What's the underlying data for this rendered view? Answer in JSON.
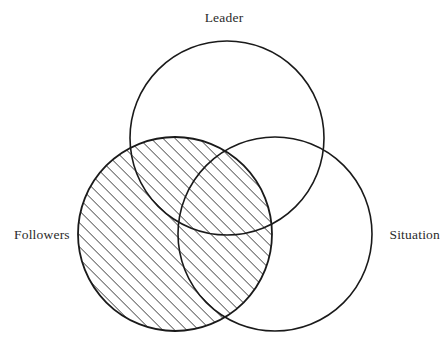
{
  "diagram": {
    "type": "venn-3-circle",
    "title_visible": false,
    "background_color": "#ffffff",
    "stroke_color": "#1a1a1a",
    "hatch_color": "#1a1a1a",
    "label_color": "#2b2b2b",
    "canvas": {
      "width": 448,
      "height": 349
    },
    "labels": {
      "leader": "Leader",
      "followers": "Followers",
      "situation": "Situation"
    },
    "circles": [
      {
        "name": "leader",
        "label": "Leader",
        "cx": 227,
        "cy": 138,
        "r": 97,
        "fill": "none",
        "stroke_width": 1.6,
        "label_position": "top"
      },
      {
        "name": "followers",
        "label": "Followers",
        "cx": 175,
        "cy": 234,
        "r": 97,
        "fill": "diagonal-hatch",
        "stroke_width": 1.6,
        "label_position": "left"
      },
      {
        "name": "situation",
        "label": "Situation",
        "cx": 275,
        "cy": 234,
        "r": 97,
        "fill": "none",
        "stroke_width": 1.6,
        "label_position": "right"
      }
    ],
    "hatch": {
      "angle_degrees": 45,
      "direction": "lower-left-to-upper-right",
      "spacing_px": 6,
      "line_width_px": 1.3,
      "applies_to": "followers"
    }
  }
}
